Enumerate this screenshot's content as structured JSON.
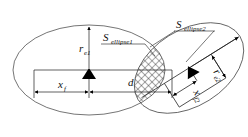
{
  "figure": {
    "background_color": "#ffffff",
    "line_color": "#3a3a3a",
    "dimension_color": "#1d1d1d",
    "text_color": "#111111",
    "hatch_color": "#2b2b2b",
    "width": 248,
    "height": 137
  },
  "labels": {
    "s_ellipse1": {
      "base": "S",
      "sub": "ellipse1",
      "x": 103,
      "y": 41
    },
    "s_ellipse2": {
      "base": "S",
      "sub": "ellipse2",
      "x": 176,
      "y": 28
    },
    "r_e1": {
      "base": "r",
      "sub": "e1",
      "x": 79,
      "y": 52
    },
    "x_f": {
      "base": "x",
      "sub": "f",
      "x": 61,
      "y": 88
    },
    "d": {
      "base": "d",
      "sub": "",
      "x": 130,
      "y": 85
    },
    "r_e2": {
      "base": "r",
      "sub": "e2",
      "x": 213,
      "y": 72,
      "rotation": 55
    },
    "x_f2": {
      "base": "x",
      "sub": "f2",
      "x": 193,
      "y": 92,
      "rotation": 60
    }
  },
  "shapes": {
    "ellipse1": {
      "cx": 89,
      "cy": 70,
      "rx": 76,
      "ry": 45,
      "rotation": 0
    },
    "ellipse2": {
      "cx": 189,
      "cy": 68,
      "rx": 60,
      "ry": 38,
      "rotation": -32
    },
    "intersection_region": "lens-shaped cross-hatched overlap"
  },
  "markers": {
    "center1": {
      "x": 89,
      "y": 70,
      "type": "filled-triangle"
    },
    "center2": {
      "x": 181,
      "y": 64,
      "type": "filled-triangle"
    }
  },
  "dimensions": {
    "r_e1": {
      "from": [
        89,
        70
      ],
      "to": [
        89,
        26
      ],
      "orientation": "vertical"
    },
    "x_f": {
      "from": [
        34,
        92
      ],
      "to": [
        89,
        92
      ],
      "orientation": "horizontal"
    },
    "d": {
      "from": [
        89,
        92
      ],
      "to": [
        172,
        92
      ],
      "orientation": "horizontal"
    },
    "r_e2": {
      "from": [
        181,
        64
      ],
      "to": [
        231,
        98
      ],
      "orientation": "oblique"
    },
    "x_f2": {
      "from": [
        181,
        64
      ],
      "to": [
        181,
        92
      ],
      "orientation": "oblique-short"
    }
  }
}
